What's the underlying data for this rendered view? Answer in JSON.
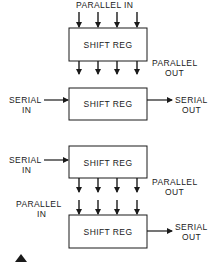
{
  "diagram": {
    "colors": {
      "stroke": "#1a1a1a",
      "background": "#ffffff"
    },
    "configurations": [
      {
        "id": "pipo",
        "box_label": "SHIFT REG",
        "input_label": "PARALLEL IN",
        "output_label_line1": "PARALLEL",
        "output_label_line2": "OUT"
      },
      {
        "id": "siso",
        "box_label": "SHIFT REG",
        "input_label_line1": "SERIAL",
        "input_label_line2": "IN",
        "output_label_line1": "SERIAL",
        "output_label_line2": "OUT"
      },
      {
        "id": "sipo",
        "box_label": "SHIFT REG",
        "input_label_line1": "SERIAL",
        "input_label_line2": "IN",
        "output_label_line1": "PARALLEL",
        "output_label_line2": "OUT"
      },
      {
        "id": "piso",
        "box_label": "SHIFT REG",
        "input_label_line1": "PARALLEL",
        "input_label_line2": "IN",
        "output_label_line1": "SERIAL",
        "output_label_line2": "OUT"
      }
    ]
  }
}
